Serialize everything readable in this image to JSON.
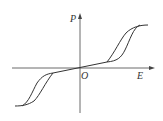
{
  "diagram": {
    "type": "double-hysteresis-loop",
    "labels": {
      "y_axis": "P",
      "x_axis": "E",
      "origin": "O"
    },
    "colors": {
      "line": "#333333",
      "background": "#ffffff"
    }
  }
}
